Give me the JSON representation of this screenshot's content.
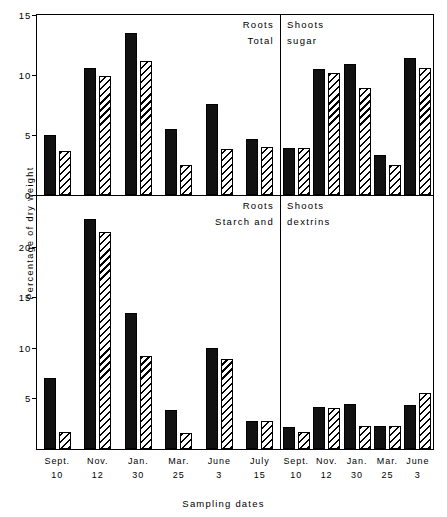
{
  "figure": {
    "ylabel": "Percentage of dry weight",
    "xlabel": "Sampling dates"
  },
  "panels": {
    "top_left": {
      "title1": "Roots",
      "title2": "Total"
    },
    "top_right": {
      "title1": "Shoots",
      "title2": "sugar"
    },
    "bottom_left": {
      "title1": "Roots",
      "title2": "Starch and"
    },
    "bottom_right": {
      "title1": "Shoots",
      "title2": "dextrins"
    }
  },
  "axes": {
    "top_ticks": [
      "15",
      "10",
      "5",
      "0"
    ],
    "top_tick_values": [
      15,
      10,
      5,
      0
    ],
    "bottom_ticks": [
      "20",
      "15",
      "10",
      "5"
    ],
    "bottom_tick_values": [
      20,
      15,
      10,
      5
    ],
    "top_ylim": [
      0,
      15
    ],
    "bottom_ylim": [
      0,
      25
    ]
  },
  "xaxis": {
    "left_dates": [
      {
        "d1": "Sept.",
        "d2": "10"
      },
      {
        "d1": "Nov.",
        "d2": "12"
      },
      {
        "d1": "Jan.",
        "d2": "30"
      },
      {
        "d1": "Mar.",
        "d2": "25"
      },
      {
        "d1": "June",
        "d2": "3"
      },
      {
        "d1": "July",
        "d2": "15"
      }
    ],
    "right_dates": [
      {
        "d1": "Sept.",
        "d2": "10"
      },
      {
        "d1": "Nov.",
        "d2": "12"
      },
      {
        "d1": "Jan.",
        "d2": "30"
      },
      {
        "d1": "Mar.",
        "d2": "25"
      },
      {
        "d1": "June",
        "d2": "3"
      }
    ]
  },
  "chart_data": [
    {
      "type": "bar",
      "title": "Roots — Total sugar",
      "panel": "top-left",
      "xlabel": "Sampling dates",
      "ylabel": "Percentage of dry weight",
      "ylim": [
        0,
        15
      ],
      "yticks": [
        0,
        5,
        10,
        15
      ],
      "grid": false,
      "legend": "none",
      "categories": [
        "Sept. 10",
        "Nov. 12",
        "Jan. 30",
        "Mar. 25",
        "June 3",
        "July 15"
      ],
      "series": [
        {
          "name": "solid",
          "values": [
            5.0,
            10.6,
            13.5,
            5.5,
            7.6,
            4.7
          ]
        },
        {
          "name": "hatched",
          "values": [
            3.7,
            9.9,
            11.2,
            2.5,
            3.8,
            4.0
          ]
        }
      ]
    },
    {
      "type": "bar",
      "title": "Shoots — Total sugar",
      "panel": "top-right",
      "xlabel": "Sampling dates",
      "ylabel": "Percentage of dry weight",
      "ylim": [
        0,
        15
      ],
      "yticks": [
        0,
        5,
        10,
        15
      ],
      "grid": false,
      "legend": "none",
      "categories": [
        "Sept. 10",
        "Nov. 12",
        "Jan. 30",
        "Mar. 25",
        "June 3"
      ],
      "series": [
        {
          "name": "solid",
          "values": [
            3.9,
            10.5,
            10.9,
            3.3,
            11.4
          ]
        },
        {
          "name": "hatched",
          "values": [
            3.9,
            10.2,
            8.9,
            2.5,
            10.6
          ]
        }
      ]
    },
    {
      "type": "bar",
      "title": "Roots — Starch and dextrins",
      "panel": "bottom-left",
      "xlabel": "Sampling dates",
      "ylabel": "Percentage of dry weight",
      "ylim": [
        0,
        25
      ],
      "yticks": [
        5,
        10,
        15,
        20
      ],
      "grid": false,
      "legend": "none",
      "categories": [
        "Sept. 10",
        "Nov. 12",
        "Jan. 30",
        "Mar. 25",
        "June 3",
        "July 15"
      ],
      "series": [
        {
          "name": "solid",
          "values": [
            7.0,
            22.7,
            13.4,
            3.9,
            10.0,
            2.8
          ]
        },
        {
          "name": "hatched",
          "values": [
            1.7,
            21.4,
            9.2,
            1.6,
            8.9,
            2.8
          ]
        }
      ]
    },
    {
      "type": "bar",
      "title": "Shoots — Starch and dextrins",
      "panel": "bottom-right",
      "xlabel": "Sampling dates",
      "ylabel": "Percentage of dry weight",
      "ylim": [
        0,
        25
      ],
      "yticks": [
        5,
        10,
        15,
        20
      ],
      "grid": false,
      "legend": "none",
      "categories": [
        "Sept. 10",
        "Nov. 12",
        "Jan. 30",
        "Mar. 25",
        "June 3"
      ],
      "series": [
        {
          "name": "solid",
          "values": [
            2.2,
            4.2,
            4.4,
            2.3,
            4.3
          ]
        },
        {
          "name": "hatched",
          "values": [
            1.7,
            4.1,
            2.3,
            2.3,
            5.5
          ]
        }
      ]
    }
  ]
}
